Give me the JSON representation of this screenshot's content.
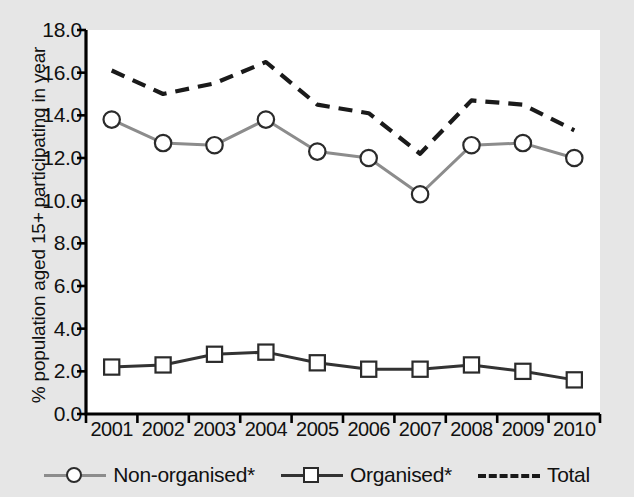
{
  "chart_data": {
    "type": "line",
    "title": "",
    "xlabel": "",
    "ylabel": "% population aged 15+ participating in year",
    "categories": [
      "2001",
      "2002",
      "2003",
      "2004",
      "2005",
      "2006",
      "2007",
      "2008",
      "2009",
      "2010"
    ],
    "x": [
      2001,
      2002,
      2003,
      2004,
      2005,
      2006,
      2007,
      2008,
      2009,
      2010
    ],
    "ylim": [
      0.0,
      18.0
    ],
    "yticks": [
      "0.0",
      "2.0",
      "4.0",
      "6.0",
      "8.0",
      "10.0",
      "12.0",
      "14.0",
      "16.0",
      "18.0"
    ],
    "ytick_values": [
      0.0,
      2.0,
      4.0,
      6.0,
      8.0,
      10.0,
      12.0,
      14.0,
      16.0,
      18.0
    ],
    "grid": false,
    "legend_position": "bottom",
    "series": [
      {
        "name": "Non-organised*",
        "marker": "circle",
        "linestyle": "solid",
        "color": "#8c8c8c",
        "values": [
          13.8,
          12.7,
          12.6,
          13.8,
          12.3,
          12.0,
          10.3,
          12.6,
          12.7,
          12.0
        ]
      },
      {
        "name": "Organised*",
        "marker": "square",
        "linestyle": "solid",
        "color": "#333333",
        "values": [
          2.2,
          2.3,
          2.8,
          2.9,
          2.4,
          2.1,
          2.1,
          2.3,
          2.0,
          1.6
        ]
      },
      {
        "name": "Total",
        "marker": "none",
        "linestyle": "dashed",
        "color": "#1a1a1a",
        "values": [
          16.1,
          15.0,
          15.5,
          16.5,
          14.5,
          14.1,
          12.2,
          14.7,
          14.5,
          13.3
        ]
      }
    ]
  },
  "legend": {
    "items": [
      {
        "label": "Non-organised*",
        "marker": "circle-marker",
        "line": "solid",
        "color": "#8c8c8c"
      },
      {
        "label": "Organised*",
        "marker": "square-marker",
        "line": "solid",
        "color": "#333333"
      },
      {
        "label": "Total",
        "marker": "none",
        "line": "dashed",
        "color": "#1a1a1a"
      }
    ]
  },
  "colors": {
    "page_background": "#e6e6e6",
    "plot_background": "#ffffff",
    "axis": "#000000"
  }
}
